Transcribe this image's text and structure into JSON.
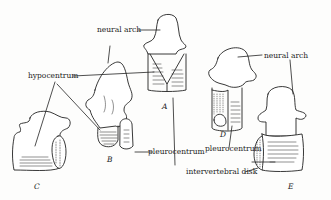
{
  "diagram": {
    "labels": {
      "neural_arch_1": "neural arch",
      "neural_arch_2": "neural arch",
      "hypocentrum": "hypocentrum",
      "pleurocentrum_1": "pleurocentrum",
      "pleurocentrum_2": "pleurocentrum",
      "intervertebral_disk": "intervertebral disk"
    },
    "figures": [
      "A",
      "B",
      "C",
      "D",
      "E"
    ],
    "colors": {
      "ink": "#222222",
      "paper": "#fdfdfc"
    }
  }
}
